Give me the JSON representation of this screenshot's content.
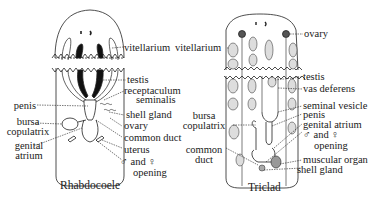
{
  "figures": [
    {
      "id": "rhabdocoele",
      "caption": "Rhabdocoele",
      "labels": {
        "vitellarium": "vitellarium",
        "testis": "testis",
        "receptaculum_1": "receptaculum",
        "receptaculum_2": "seminalis",
        "penis": "penis",
        "shell_gland": "shell gland",
        "bursa_1": "bursa",
        "bursa_2": "copulatrix",
        "ovary": "ovary",
        "genital_1": "genital",
        "genital_2": "atrium",
        "common_duct": "common duct",
        "uterus": "uterus",
        "opening_1": "♂ and ♀",
        "opening_2": "opening"
      }
    },
    {
      "id": "triclad",
      "caption": "Triclad",
      "labels": {
        "ovary": "ovary",
        "vitellarium": "vitellarium",
        "testis": "testis",
        "vas_deferens": "vas deferens",
        "seminal_vesicle": "seminal vesicle",
        "penis": "penis",
        "bursa_1": "bursa",
        "bursa_2": "copulatrix",
        "genital_atrium": "genital atrium",
        "opening_1": "♂ and ♀",
        "opening_2": "opening",
        "common_1": "common",
        "common_2": "duct",
        "muscular_organ": "muscular organ",
        "shell_gland": "shell gland"
      }
    }
  ]
}
